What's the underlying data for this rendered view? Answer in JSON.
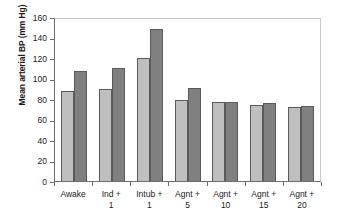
{
  "chart_data": {
    "type": "bar",
    "title": "",
    "subtitle": "",
    "xlabel": "",
    "ylabel": "Mean arterial BP (mm Hg)",
    "categories": [
      "Awake",
      "Ind + 1",
      "Intub + 1",
      "Agnt + 5",
      "Agnt + 10",
      "Agnt + 15",
      "Agnt + 20"
    ],
    "series": [
      {
        "name": "series-1",
        "color": "#bfbfbf",
        "values": [
          88,
          90,
          120,
          79,
          77,
          74,
          72
        ]
      },
      {
        "name": "series-2",
        "color": "#808080",
        "values": [
          107,
          110,
          148,
          91,
          77,
          76,
          73
        ]
      }
    ],
    "ylim": [
      0,
      160
    ],
    "ytick_step": 20,
    "yticks": [
      160,
      140,
      120,
      100,
      80,
      60,
      40,
      20,
      0
    ],
    "ytick_labels": [
      "160",
      "140",
      "120",
      "100",
      "80",
      "60",
      "40",
      "20",
      "0"
    ],
    "grid": false,
    "legend": false,
    "legend_position": "none",
    "axis_color": "#6e6e6e",
    "bar_border_color": "#5a5a5a",
    "background": "#ffffff"
  }
}
